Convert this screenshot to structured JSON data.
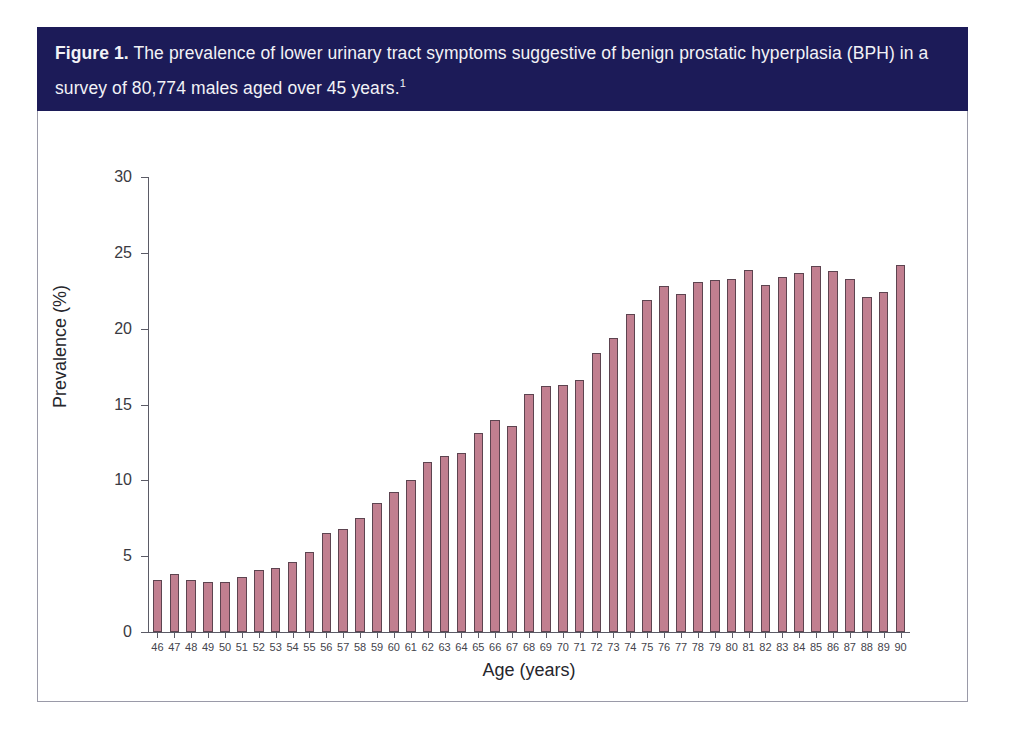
{
  "figure": {
    "label": "Figure 1.",
    "caption": "The prevalence of lower urinary tract symptoms suggestive of benign prostatic hyperplasia (BPH) in a survey of 80,774 males aged over 45 years.",
    "footnote_marker": "1",
    "banner_color": "#1c1b58",
    "banner_text_color": "#f2f2f6",
    "panel_border_color": "#9a9aa8"
  },
  "chart_data": {
    "type": "bar",
    "title": "The prevalence of lower urinary tract symptoms suggestive of benign prostatic hyperplasia (BPH) in a survey of 80,774 males aged over 45 years.",
    "subtitle": "",
    "xlabel": "Age (years)",
    "ylabel": "Prevalence (%)",
    "ylim": [
      0,
      30
    ],
    "yticks": [
      0,
      5,
      10,
      15,
      20,
      25,
      30
    ],
    "ytick_labels": [
      "0",
      "5",
      "10",
      "15",
      "20",
      "25",
      "30"
    ],
    "grid": false,
    "legend": false,
    "bar_color": "#c17f90",
    "bar_edge_color": "#5d4450",
    "categories": [
      "46",
      "47",
      "48",
      "49",
      "50",
      "51",
      "52",
      "53",
      "54",
      "55",
      "56",
      "57",
      "58",
      "59",
      "60",
      "61",
      "62",
      "63",
      "64",
      "65",
      "66",
      "67",
      "68",
      "69",
      "70",
      "71",
      "72",
      "73",
      "74",
      "75",
      "76",
      "77",
      "78",
      "79",
      "80",
      "81",
      "82",
      "83",
      "84",
      "85",
      "86",
      "87",
      "88",
      "89",
      "90"
    ],
    "values": [
      3.4,
      3.8,
      3.4,
      3.3,
      3.3,
      3.6,
      4.1,
      4.2,
      4.6,
      5.3,
      6.5,
      6.8,
      7.5,
      8.5,
      9.2,
      10.0,
      11.2,
      11.6,
      11.8,
      13.1,
      14.0,
      13.6,
      15.7,
      16.2,
      16.3,
      16.6,
      18.4,
      19.4,
      21.0,
      21.9,
      22.8,
      22.3,
      23.1,
      23.2,
      23.3,
      23.9,
      22.9,
      23.4,
      23.7,
      24.1,
      23.8,
      23.3,
      22.1,
      22.4,
      24.2
    ]
  }
}
